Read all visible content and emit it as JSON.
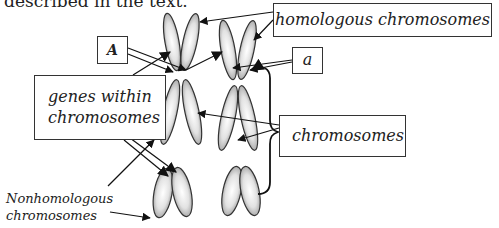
{
  "intro_text": "described in the text.",
  "labels": {
    "allele_A": "A",
    "allele_a": "a",
    "homologous": "homologous chromosomes",
    "genes_line1": "genes within",
    "genes_line2": "chromosomes",
    "chromosomes": "chromosomes",
    "nonhomologous_line1": "Nonhomologous",
    "nonhomologous_line2": "chromosomes"
  }
}
